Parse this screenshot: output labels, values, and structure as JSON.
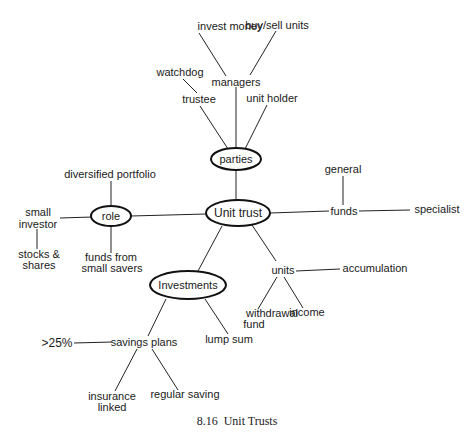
{
  "diagram": {
    "type": "mind-map",
    "central": "Unit trust",
    "ovals": {
      "unit_trust": "Unit trust",
      "parties": "parties",
      "role": "role",
      "investments": "Investments"
    },
    "parties": {
      "trustee": "trustee",
      "watchdog": "watchdog",
      "managers": "managers",
      "invest_money": "invest money",
      "buy_sell_units": "buy/sell units",
      "unit_holder": "unit holder"
    },
    "role": {
      "diversified_portfolio": "diversified portfolio",
      "small_investor_1": "small",
      "small_investor_2": "investor",
      "stocks_1": "stocks &",
      "stocks_2": "shares",
      "funds_from_1": "funds from",
      "funds_from_2": "small savers"
    },
    "funds": {
      "label": "funds",
      "general": "general",
      "specialist": "specialist"
    },
    "units": {
      "label": "units",
      "accumulation": "accumulation",
      "withdrawal_1": "withdrawal",
      "withdrawal_2": "fund",
      "income": "income"
    },
    "investments": {
      "savings_plans": "savings plans",
      "gt25": ">25%",
      "lump_sum": "lump sum",
      "insurance_1": "insurance",
      "insurance_2": "linked",
      "regular_saving": "regular saving"
    },
    "caption": "8.16  Unit Trusts"
  }
}
